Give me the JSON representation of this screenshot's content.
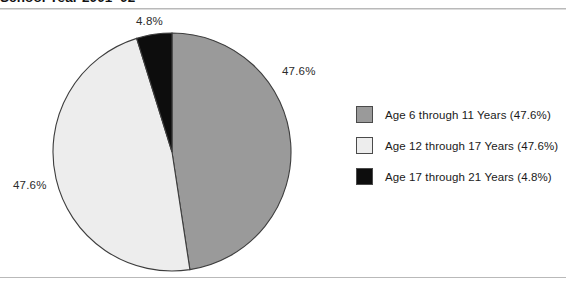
{
  "figure": {
    "title": "School Year 2001–02"
  },
  "chart_data": {
    "type": "pie",
    "title": "School Year 2001–02",
    "xlabel": "",
    "ylabel": "",
    "legend_position": "right",
    "grid": false,
    "categories": [
      "Age 6 through 11 Years",
      "Age 12 through 17 Years",
      "Age 17 through 21 Years"
    ],
    "values": [
      47.6,
      47.6,
      4.8
    ],
    "value_labels": [
      "47.6%",
      "47.6%",
      "4.8%"
    ],
    "colors": [
      "#9a9a9a",
      "#ededed",
      "#0d0d0d"
    ],
    "slice_edge_color": "#3d3d3d",
    "legend_entries": [
      "Age 6 through 11 Years (47.6%)",
      "Age 12 through 17 Years (47.6%)",
      "Age 17 through 21 Years (4.8%)"
    ],
    "callouts": [
      {
        "text": "4.8%",
        "position": "top"
      },
      {
        "text": "47.6%",
        "position": "right"
      },
      {
        "text": "47.6%",
        "position": "left"
      }
    ]
  },
  "legend": {
    "items": [
      {
        "label": "Age 6 through 11 Years (47.6%)",
        "color": "#9a9a9a"
      },
      {
        "label": "Age 12 through 17 Years (47.6%)",
        "color": "#ededed"
      },
      {
        "label": "Age 17 through 21 Years (4.8%)",
        "color": "#0d0d0d"
      }
    ]
  }
}
